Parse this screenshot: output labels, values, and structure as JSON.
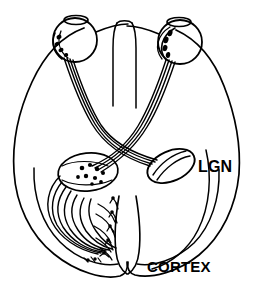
{
  "figure": {
    "background_color": "#ffffff",
    "ink_color": "#000000"
  },
  "labels": {
    "lgn": "LGN",
    "cortex": "CORTEX"
  },
  "structures": {
    "left_eye": "left-eye",
    "right_eye": "right-eye",
    "left_lens": "left-lens",
    "right_lens": "right-lens",
    "left_retinal_cells": "left-retinal-ganglion-cells",
    "right_retinal_cells": "right-retinal-ganglion-cells",
    "left_optic_nerve": "left-optic-nerve",
    "right_optic_nerve": "right-optic-nerve",
    "optic_chiasm": "optic-chiasm",
    "left_lgn": "left-lateral-geniculate-nucleus",
    "right_lgn": "right-lateral-geniculate-nucleus",
    "optic_radiation": "optic-radiation",
    "cortical_neurons": "cortical-neurons",
    "brain_outline": "brain-outline",
    "cortex_contour": "cortex-contour",
    "midline_fissure": "interhemispheric-fissure"
  }
}
